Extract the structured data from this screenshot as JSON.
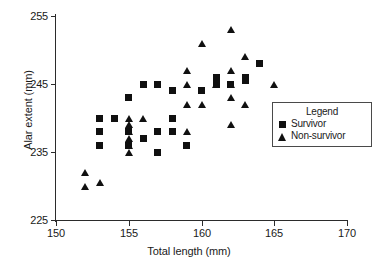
{
  "chart_data": {
    "type": "scatter",
    "title": "",
    "xlabel": "Total length (mm)",
    "ylabel": "Alar extent (mm)",
    "xlim": [
      150,
      170
    ],
    "ylim": [
      225,
      255
    ],
    "xticks": [
      150,
      155,
      160,
      165,
      170
    ],
    "yticks": [
      225,
      235,
      245,
      255
    ],
    "grid": false,
    "legend": {
      "title": "Legend",
      "position": "right-middle",
      "entries": [
        {
          "label": "Survivor",
          "marker": "square"
        },
        {
          "label": "Non-survivor",
          "marker": "triangle"
        }
      ]
    },
    "series": [
      {
        "name": "Survivor",
        "marker": "square",
        "points": [
          [
            153,
            240
          ],
          [
            153,
            238
          ],
          [
            153,
            236
          ],
          [
            154,
            240
          ],
          [
            155,
            243
          ],
          [
            155,
            238
          ],
          [
            155,
            236
          ],
          [
            156,
            245
          ],
          [
            156,
            237
          ],
          [
            157,
            245
          ],
          [
            157,
            238
          ],
          [
            157,
            235
          ],
          [
            158,
            244
          ],
          [
            158,
            240
          ],
          [
            158,
            238
          ],
          [
            159,
            236
          ],
          [
            160,
            244
          ],
          [
            161,
            246
          ],
          [
            161,
            245
          ],
          [
            162,
            245
          ],
          [
            163,
            246
          ],
          [
            163,
            245.5
          ],
          [
            164,
            248
          ]
        ]
      },
      {
        "name": "Non-survivor",
        "marker": "triangle",
        "points": [
          [
            152,
            232
          ],
          [
            152,
            230
          ],
          [
            153,
            230.5
          ],
          [
            155,
            240
          ],
          [
            155,
            239
          ],
          [
            155,
            238
          ],
          [
            155,
            237
          ],
          [
            155,
            236
          ],
          [
            155,
            235
          ],
          [
            156,
            240
          ],
          [
            159,
            247
          ],
          [
            159,
            245
          ],
          [
            159,
            242
          ],
          [
            159,
            238
          ],
          [
            160,
            251
          ],
          [
            160,
            242
          ],
          [
            161,
            245
          ],
          [
            162,
            253
          ],
          [
            162,
            247
          ],
          [
            162,
            245
          ],
          [
            162,
            243
          ],
          [
            162,
            239
          ],
          [
            163,
            249
          ],
          [
            163,
            242
          ],
          [
            165,
            245
          ]
        ]
      }
    ]
  },
  "axes": {
    "y_tick_labels": [
      "255",
      "245",
      "235",
      "225"
    ],
    "x_tick_labels": [
      "150",
      "155",
      "160",
      "165",
      "170"
    ],
    "y_title": "Alar extent  (mm)",
    "x_title": "Total length (mm)"
  },
  "legend": {
    "title": "Legend",
    "survivor_label": "Survivor",
    "nonsurvivor_label": "Non-survivor"
  },
  "colors": {
    "marker": "#101010",
    "axis": "#2b2b2b",
    "legend_border": "#4a4a4a",
    "background": "#ffffff"
  },
  "artifact": {
    "top_text": ". . ."
  }
}
